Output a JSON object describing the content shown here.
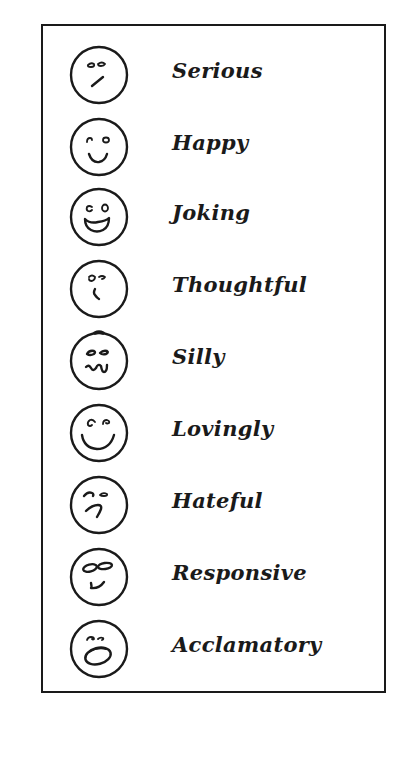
{
  "legend": {
    "items": [
      {
        "label": "Serious",
        "icon": "serious-face-icon"
      },
      {
        "label": "Happy",
        "icon": "happy-face-icon"
      },
      {
        "label": "Joking",
        "icon": "joking-face-icon"
      },
      {
        "label": "Thoughtful",
        "icon": "thoughtful-face-icon"
      },
      {
        "label": "Silly",
        "icon": "silly-face-icon"
      },
      {
        "label": "Lovingly",
        "icon": "loving-face-icon"
      },
      {
        "label": "Hateful",
        "icon": "hateful-face-icon"
      },
      {
        "label": "Responsive",
        "icon": "responsive-face-icon"
      },
      {
        "label": "Acclamatory",
        "icon": "acclamatory-face-icon"
      }
    ]
  },
  "colors": {
    "ink": "#1a1a1a",
    "background": "#ffffff"
  }
}
